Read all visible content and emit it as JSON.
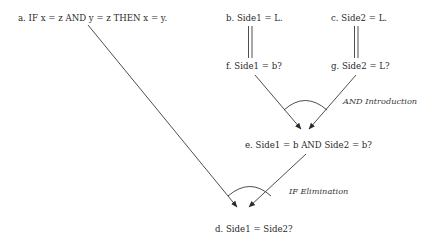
{
  "diagram": {
    "nodes": {
      "a": {
        "label": "a. IF x = z AND y = z THEN x = y."
      },
      "b": {
        "label": "b. Side1 = L."
      },
      "c": {
        "label": "c. Side2 = L."
      },
      "f": {
        "label": "f. Side1 = b?"
      },
      "g": {
        "label": "g. Side2 = L?"
      },
      "e": {
        "label": "e. Side1 = b AND Side2 = b?"
      },
      "d": {
        "label": "d. Side1 = Side2?"
      }
    },
    "rules": {
      "and_intro": {
        "label": "AND Introduction"
      },
      "if_elim": {
        "label": "IF Elimination"
      }
    },
    "edges": [
      {
        "from": "b",
        "to": "f",
        "style": "double-line"
      },
      {
        "from": "c",
        "to": "g",
        "style": "double-line"
      },
      {
        "from": "f",
        "to": "e",
        "style": "arrow"
      },
      {
        "from": "g",
        "to": "e",
        "style": "arrow"
      },
      {
        "from": "a",
        "to": "d",
        "style": "arrow"
      },
      {
        "from": "e",
        "to": "d",
        "style": "arrow"
      }
    ],
    "colors": {
      "ink": "#2a2a2a",
      "background": "#ffffff"
    }
  }
}
